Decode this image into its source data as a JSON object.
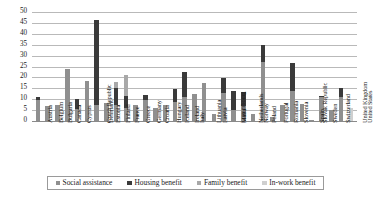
{
  "chart_data": {
    "type": "bar",
    "subtype": "stacked",
    "title": "",
    "xlabel": "",
    "ylabel": "",
    "ylim": [
      0,
      50
    ],
    "ytick_values": [
      0,
      5,
      10,
      15,
      20,
      25,
      30,
      35,
      40,
      45,
      50
    ],
    "ytick_labels": [
      "0",
      "5",
      "10",
      "15",
      "20",
      "25",
      "30",
      "35",
      "40",
      "45",
      "50"
    ],
    "grid": true,
    "legend_position": "bottom",
    "categories": [
      "Austria",
      "Belgium",
      "Bulgaria",
      "Canada",
      "Cyprus",
      "Czech Republic",
      "Denmark",
      "Estonia",
      "Finland",
      "France",
      "Greece",
      "Germany",
      "Croatia",
      "Hungary",
      "Iceland",
      "Ireland",
      "Italy",
      "Lithuania",
      "Latvia",
      "Luxembourg",
      "Malta",
      "Netherlands",
      "Norway",
      "Poland",
      "Portugal",
      "Romania",
      "Slovenia",
      "Slovak Republic",
      "Spain",
      "Sweden",
      "Switzerland",
      "United Kingdom",
      "United States"
    ],
    "series": [
      {
        "name": "Social assistance",
        "color": "#8f8f8f",
        "values": [
          9.8,
          7.0,
          7.3,
          24.0,
          5.3,
          18.5,
          7.5,
          8.3,
          7.5,
          5.8,
          7.5,
          9.8,
          5.8,
          7.5,
          8.8,
          11.0,
          12.2,
          17.3,
          3.3,
          13.0,
          5.2,
          6.7,
          3.3,
          27.0,
          2.0,
          7.3,
          13.7,
          7.8,
          0.6,
          10.8,
          5.0,
          10.8,
          0.0
        ]
      },
      {
        "name": "Housing benefit",
        "color": "#3a3a3a",
        "values": [
          1.3,
          0.0,
          0.0,
          0.0,
          4.6,
          0.0,
          39.0,
          0.0,
          7.5,
          5.8,
          0.0,
          2.2,
          0.0,
          0.0,
          5.8,
          11.5,
          0.0,
          0.0,
          0.0,
          6.8,
          8.8,
          6.5,
          0.0,
          7.8,
          0.0,
          0.0,
          12.8,
          0.0,
          0.0,
          0.8,
          0.0,
          4.5,
          0.0
        ]
      },
      {
        "name": "Family benefit",
        "color": "#a8a8a8",
        "values": [
          0.0,
          0.0,
          0.0,
          0.0,
          0.0,
          0.0,
          0.0,
          0.0,
          2.8,
          9.4,
          0.0,
          0.0,
          0.0,
          0.0,
          0.0,
          0.0,
          0.0,
          0.0,
          0.0,
          0.0,
          0.0,
          0.0,
          0.0,
          0.0,
          0.0,
          0.0,
          0.0,
          0.0,
          0.0,
          0.0,
          0.0,
          0.0,
          0.0
        ]
      },
      {
        "name": "In-work benefit",
        "color": "#cfcfcf",
        "values": [
          0.0,
          0.0,
          0.0,
          0.0,
          0.0,
          0.0,
          0.0,
          0.0,
          0.0,
          0.0,
          0.0,
          0.0,
          0.0,
          0.0,
          0.0,
          0.0,
          0.0,
          0.0,
          0.0,
          0.0,
          0.0,
          0.0,
          0.0,
          0.0,
          0.0,
          0.0,
          0.0,
          0.0,
          0.0,
          0.0,
          0.0,
          0.0,
          6.0
        ]
      }
    ],
    "totals": [
      11.1,
      7.0,
      7.3,
      24.0,
      9.9,
      18.5,
      46.5,
      8.3,
      17.8,
      21.0,
      7.5,
      12.0,
      5.8,
      7.5,
      14.6,
      22.5,
      12.2,
      17.3,
      3.3,
      19.8,
      14.0,
      13.2,
      3.3,
      34.8,
      2.0,
      7.3,
      26.5,
      7.8,
      0.6,
      11.6,
      5.0,
      15.3,
      6.0
    ]
  },
  "legend": {
    "items": [
      {
        "label": "Social assistance",
        "color": "#8f8f8f"
      },
      {
        "label": "Housing benefit",
        "color": "#3a3a3a"
      },
      {
        "label": "Family benefit",
        "color": "#a8a8a8"
      },
      {
        "label": "In-work benefit",
        "color": "#cfcfcf"
      }
    ]
  }
}
